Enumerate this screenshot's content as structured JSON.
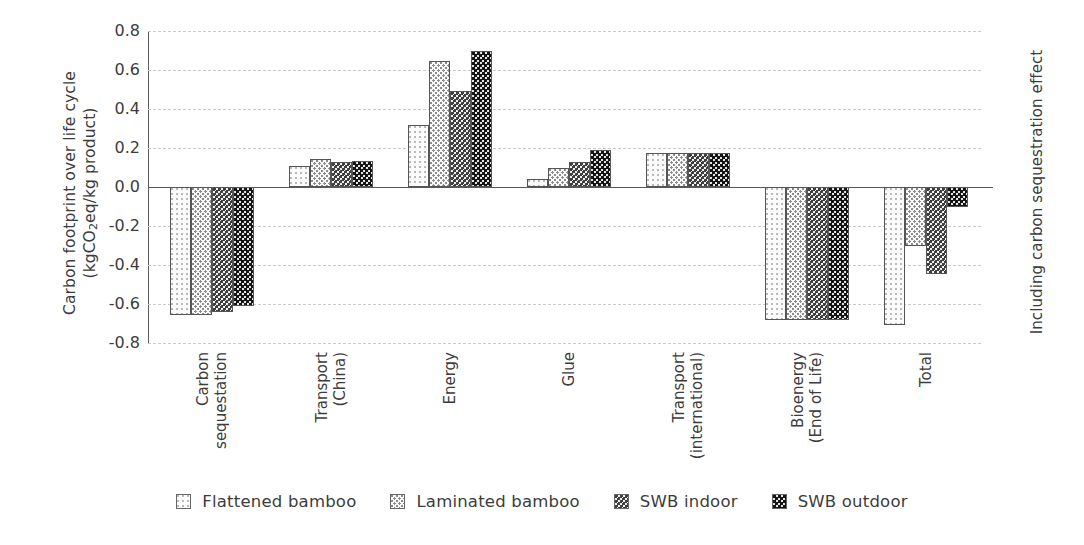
{
  "chart_data": {
    "type": "bar",
    "title": "",
    "subtitle": "",
    "ylabel_line1": "Carbon footprint over life cycle",
    "ylabel_line2": "(kgCO2eq/kg product)",
    "ylabel_right": "Including carbon sequestration effect",
    "xlabel": "",
    "ylim": [
      -0.8,
      0.8
    ],
    "yticks": [
      "0.8",
      "0.6",
      "0.4",
      "0.2",
      "0.0",
      "-0.2",
      "-0.4",
      "-0.6",
      "-0.8"
    ],
    "ytick_values": [
      0.8,
      0.6,
      0.4,
      0.2,
      0.0,
      -0.2,
      -0.4,
      -0.6,
      -0.8
    ],
    "grid": true,
    "legend_position": "bottom",
    "categories": [
      "Carbon sequestration",
      "Transport (China)",
      "Energy",
      "Glue",
      "Transport (international)",
      "Bioenergy (End of Life)",
      "Total"
    ],
    "category_label_lines": [
      [
        "Carbon",
        "sequestation"
      ],
      [
        "Transport",
        "(China)"
      ],
      [
        "Energy"
      ],
      [
        "Glue"
      ],
      [
        "Transport",
        "(international)"
      ],
      [
        "Bioenergy",
        "(End of Life)"
      ],
      [
        "Total"
      ]
    ],
    "series": [
      {
        "name": "Flattened bamboo",
        "pattern": "light-dots",
        "values": [
          -0.655,
          0.11,
          0.32,
          0.04,
          0.175,
          -0.68,
          -0.71
        ]
      },
      {
        "name": "Laminated bamboo",
        "pattern": "medium-dots",
        "values": [
          -0.655,
          0.145,
          0.645,
          0.095,
          0.175,
          -0.68,
          -0.3
        ]
      },
      {
        "name": "SWB indoor",
        "pattern": "dark-checker",
        "values": [
          -0.64,
          0.13,
          0.49,
          0.13,
          0.175,
          -0.68,
          -0.445
        ]
      },
      {
        "name": "SWB outdoor",
        "pattern": "darkest-checker",
        "values": [
          -0.61,
          0.135,
          0.7,
          0.19,
          0.175,
          -0.68,
          -0.105
        ]
      }
    ]
  },
  "legend": {
    "items": [
      {
        "label": "Flattened bamboo"
      },
      {
        "label": "Laminated bamboo"
      },
      {
        "label": "SWB indoor"
      },
      {
        "label": "SWB outdoor"
      }
    ]
  }
}
